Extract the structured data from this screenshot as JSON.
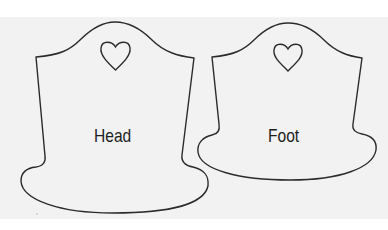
{
  "figure": {
    "background": "#f2f2f2",
    "stroke_color": "#2b2b2b",
    "pieces": [
      {
        "id": "head",
        "label": "Head",
        "heart_cutout": true
      },
      {
        "id": "foot",
        "label": "Foot",
        "heart_cutout": true
      }
    ]
  }
}
